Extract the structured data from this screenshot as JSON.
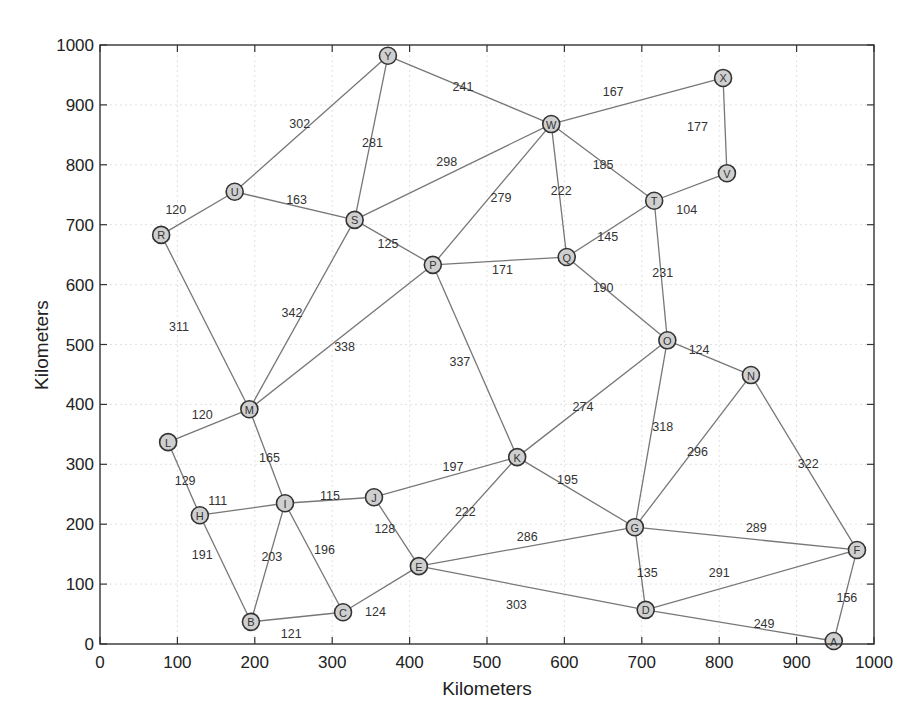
{
  "chart_data": {
    "type": "network-graph",
    "title": "",
    "xlabel": "Kilometers",
    "ylabel": "Kilometers",
    "xlim": [
      0,
      1000
    ],
    "ylim": [
      0,
      1000
    ],
    "xticks": [
      0,
      100,
      200,
      300,
      400,
      500,
      600,
      700,
      800,
      900,
      1000
    ],
    "yticks": [
      0,
      100,
      200,
      300,
      400,
      500,
      600,
      700,
      800,
      900,
      1000
    ],
    "grid": true,
    "nodes": [
      {
        "id": "A",
        "x": 948,
        "y": 5
      },
      {
        "id": "B",
        "x": 195,
        "y": 37
      },
      {
        "id": "C",
        "x": 314,
        "y": 53
      },
      {
        "id": "D",
        "x": 705,
        "y": 57
      },
      {
        "id": "E",
        "x": 412,
        "y": 130
      },
      {
        "id": "F",
        "x": 978,
        "y": 157
      },
      {
        "id": "G",
        "x": 691,
        "y": 195
      },
      {
        "id": "H",
        "x": 129,
        "y": 215
      },
      {
        "id": "I",
        "x": 239,
        "y": 235
      },
      {
        "id": "J",
        "x": 354,
        "y": 245
      },
      {
        "id": "K",
        "x": 539,
        "y": 312
      },
      {
        "id": "L",
        "x": 88,
        "y": 337
      },
      {
        "id": "M",
        "x": 193,
        "y": 392
      },
      {
        "id": "N",
        "x": 841,
        "y": 449
      },
      {
        "id": "O",
        "x": 733,
        "y": 507
      },
      {
        "id": "P",
        "x": 430,
        "y": 633
      },
      {
        "id": "Q",
        "x": 603,
        "y": 646
      },
      {
        "id": "R",
        "x": 79,
        "y": 683
      },
      {
        "id": "S",
        "x": 329,
        "y": 708
      },
      {
        "id": "T",
        "x": 716,
        "y": 740
      },
      {
        "id": "U",
        "x": 174,
        "y": 755
      },
      {
        "id": "V",
        "x": 810,
        "y": 786
      },
      {
        "id": "W",
        "x": 583,
        "y": 868
      },
      {
        "id": "X",
        "x": 805,
        "y": 945
      },
      {
        "id": "Y",
        "x": 372,
        "y": 982
      }
    ],
    "edges": [
      {
        "from": "Y",
        "to": "U",
        "weight": 302,
        "lx": 258,
        "ly": 868
      },
      {
        "from": "Y",
        "to": "S",
        "weight": 281,
        "lx": 352,
        "ly": 837
      },
      {
        "from": "Y",
        "to": "W",
        "weight": 241,
        "lx": 469,
        "ly": 930
      },
      {
        "from": "W",
        "to": "X",
        "weight": 167,
        "lx": 663,
        "ly": 922
      },
      {
        "from": "X",
        "to": "V",
        "weight": 177,
        "lx": 772,
        "ly": 863
      },
      {
        "from": "W",
        "to": "S",
        "weight": 298,
        "lx": 448,
        "ly": 805
      },
      {
        "from": "W",
        "to": "P",
        "weight": 279,
        "lx": 518,
        "ly": 745
      },
      {
        "from": "W",
        "to": "Q",
        "weight": 222,
        "lx": 596,
        "ly": 757
      },
      {
        "from": "W",
        "to": "T",
        "weight": 185,
        "lx": 650,
        "ly": 800
      },
      {
        "from": "T",
        "to": "V",
        "weight": 104,
        "lx": 758,
        "ly": 725
      },
      {
        "from": "T",
        "to": "Q",
        "weight": 145,
        "lx": 656,
        "ly": 679
      },
      {
        "from": "T",
        "to": "O",
        "weight": 231,
        "lx": 727,
        "ly": 620
      },
      {
        "from": "R",
        "to": "U",
        "weight": 120,
        "lx": 98,
        "ly": 725
      },
      {
        "from": "U",
        "to": "S",
        "weight": 163,
        "lx": 254,
        "ly": 742
      },
      {
        "from": "S",
        "to": "P",
        "weight": 125,
        "lx": 372,
        "ly": 667
      },
      {
        "from": "P",
        "to": "Q",
        "weight": 171,
        "lx": 520,
        "ly": 624
      },
      {
        "from": "Q",
        "to": "O",
        "weight": 190,
        "lx": 650,
        "ly": 594
      },
      {
        "from": "R",
        "to": "M",
        "weight": 311,
        "lx": 102,
        "ly": 530
      },
      {
        "from": "S",
        "to": "M",
        "weight": 342,
        "lx": 248,
        "ly": 553
      },
      {
        "from": "P",
        "to": "M",
        "weight": 338,
        "lx": 316,
        "ly": 495
      },
      {
        "from": "P",
        "to": "K",
        "weight": 337,
        "lx": 465,
        "ly": 470
      },
      {
        "from": "O",
        "to": "N",
        "weight": 124,
        "lx": 774,
        "ly": 490
      },
      {
        "from": "O",
        "to": "K",
        "weight": 274,
        "lx": 624,
        "ly": 395
      },
      {
        "from": "O",
        "to": "G",
        "weight": 318,
        "lx": 727,
        "ly": 362
      },
      {
        "from": "N",
        "to": "G",
        "weight": 296,
        "lx": 772,
        "ly": 320
      },
      {
        "from": "N",
        "to": "F",
        "weight": 322,
        "lx": 915,
        "ly": 300
      },
      {
        "from": "M",
        "to": "L",
        "weight": 120,
        "lx": 132,
        "ly": 382
      },
      {
        "from": "M",
        "to": "I",
        "weight": 165,
        "lx": 219,
        "ly": 311
      },
      {
        "from": "L",
        "to": "H",
        "weight": 129,
        "lx": 110,
        "ly": 272
      },
      {
        "from": "H",
        "to": "I",
        "weight": 111,
        "lx": 152,
        "ly": 238
      },
      {
        "from": "I",
        "to": "J",
        "weight": 115,
        "lx": 297,
        "ly": 247
      },
      {
        "from": "J",
        "to": "K",
        "weight": 197,
        "lx": 456,
        "ly": 296
      },
      {
        "from": "K",
        "to": "G",
        "weight": 195,
        "lx": 604,
        "ly": 273
      },
      {
        "from": "K",
        "to": "E",
        "weight": 222,
        "lx": 472,
        "ly": 220
      },
      {
        "from": "J",
        "to": "E",
        "weight": 128,
        "lx": 368,
        "ly": 192
      },
      {
        "from": "H",
        "to": "B",
        "weight": 191,
        "lx": 132,
        "ly": 148
      },
      {
        "from": "I",
        "to": "B",
        "weight": 203,
        "lx": 222,
        "ly": 146
      },
      {
        "from": "I",
        "to": "C",
        "weight": 196,
        "lx": 290,
        "ly": 157
      },
      {
        "from": "B",
        "to": "C",
        "weight": 121,
        "lx": 247,
        "ly": 17
      },
      {
        "from": "C",
        "to": "E",
        "weight": 124,
        "lx": 356,
        "ly": 53
      },
      {
        "from": "E",
        "to": "G",
        "weight": 286,
        "lx": 552,
        "ly": 178
      },
      {
        "from": "E",
        "to": "D",
        "weight": 303,
        "lx": 538,
        "ly": 65
      },
      {
        "from": "G",
        "to": "D",
        "weight": 135,
        "lx": 707,
        "ly": 119
      },
      {
        "from": "G",
        "to": "F",
        "weight": 289,
        "lx": 848,
        "ly": 194
      },
      {
        "from": "D",
        "to": "F",
        "weight": 291,
        "lx": 800,
        "ly": 119
      },
      {
        "from": "D",
        "to": "A",
        "weight": 249,
        "lx": 858,
        "ly": 33
      },
      {
        "from": "F",
        "to": "A",
        "weight": 156,
        "lx": 965,
        "ly": 77
      }
    ]
  },
  "colors": {
    "edge": "#777777",
    "node_fill": "#cfcfcf",
    "node_stroke": "#333333",
    "axis": "#333333",
    "grid": "#d9d9d9",
    "text": "#222222"
  }
}
